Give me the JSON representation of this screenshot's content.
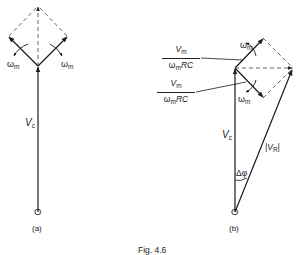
{
  "figure": {
    "caption": "Fig. 4.6",
    "panel_a": {
      "label": "(a)",
      "origin_label": "O",
      "vector_label_main": "V",
      "vector_label_sub": "c",
      "rotation_left_main": "ω",
      "rotation_left_sub": "m",
      "rotation_right_main": "ω",
      "rotation_right_sub": "m"
    },
    "panel_b": {
      "label": "(b)",
      "origin_label": "O",
      "vc_label_main": "V",
      "vc_label_sub": "c",
      "vr_label": "|V",
      "vr_label_sub": "R",
      "vr_label_end": "|",
      "angle_label": "Δφ",
      "rotation_top_main": "ω",
      "rotation_top_sub": "m",
      "rotation_bottom_main": "ω",
      "rotation_bottom_sub": "m",
      "upper_fraction": {
        "num_main": "V",
        "num_sub": "m",
        "den_main": "ω",
        "den_sub": "m",
        "den_end": "RC"
      },
      "lower_fraction": {
        "num_main": "V",
        "num_sub": "m",
        "den_main": "ω",
        "den_sub": "m",
        "den_end": "RC"
      }
    },
    "colors": {
      "line": "#1a1a1a",
      "dashed": "#555555",
      "background": "#ffffff"
    }
  }
}
